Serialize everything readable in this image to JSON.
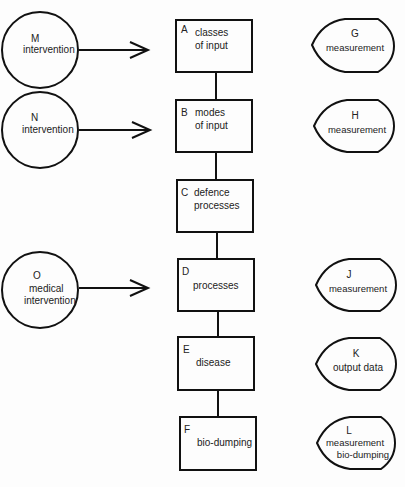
{
  "interventions": [
    {
      "id": "M",
      "letter": "M",
      "lines": [
        "intervention"
      ],
      "target": "A"
    },
    {
      "id": "N",
      "letter": "N",
      "lines": [
        "intervention"
      ],
      "target": "B"
    },
    {
      "id": "O",
      "letter": "O",
      "lines": [
        "medical",
        "intervention"
      ],
      "target": "D"
    }
  ],
  "processes": [
    {
      "id": "A",
      "letter": "A",
      "lines": [
        "classes",
        "of input"
      ]
    },
    {
      "id": "B",
      "letter": "B",
      "lines": [
        "modes",
        "of input"
      ]
    },
    {
      "id": "C",
      "letter": "C",
      "lines": [
        "defence",
        "processes"
      ]
    },
    {
      "id": "D",
      "letter": "D",
      "lines": [
        "processes"
      ]
    },
    {
      "id": "E",
      "letter": "E",
      "lines": [
        "disease"
      ]
    },
    {
      "id": "F",
      "letter": "F",
      "lines": [
        "bio-dumping"
      ]
    }
  ],
  "outputs": [
    {
      "id": "G",
      "letter": "G",
      "lines": [
        "measurement"
      ]
    },
    {
      "id": "H",
      "letter": "H",
      "lines": [
        "measurement"
      ]
    },
    {
      "id": "J",
      "letter": "J",
      "lines": [
        "measurement"
      ]
    },
    {
      "id": "K",
      "letter": "K",
      "lines": [
        "output data"
      ]
    },
    {
      "id": "L",
      "letter": "L",
      "lines": [
        "measurement",
        "bio-dumping"
      ]
    }
  ],
  "colors": {
    "stroke": "#111111",
    "text": "#222222",
    "background": "#fdfdfd"
  }
}
